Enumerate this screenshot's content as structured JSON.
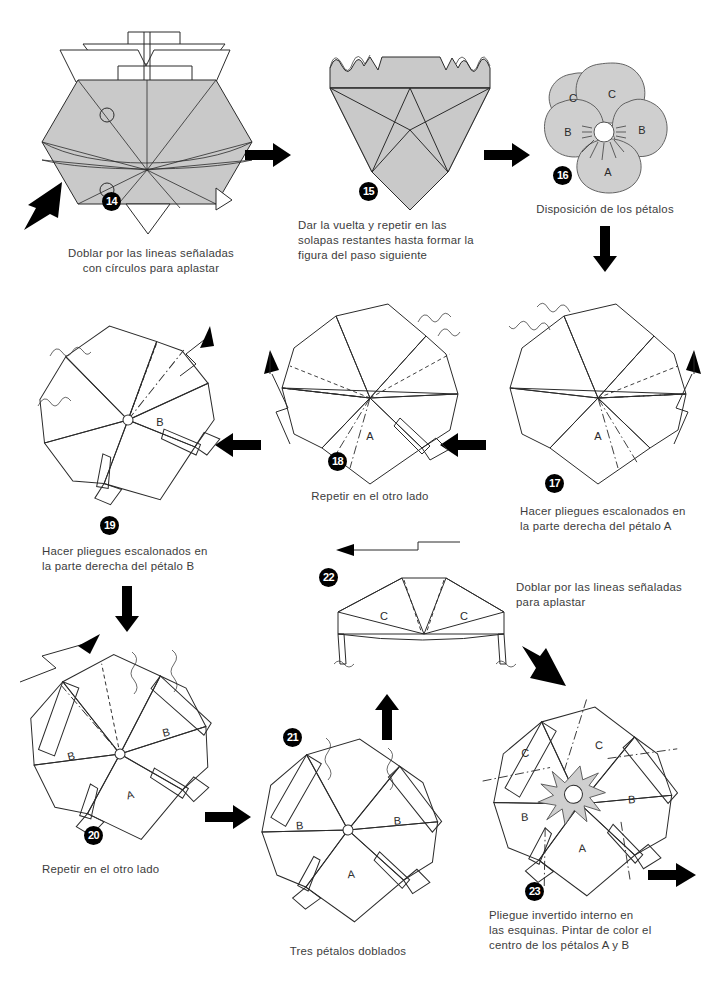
{
  "page": {
    "language": "es",
    "background_color": "#ffffff",
    "paper_fill_color": "#c9c9c9",
    "line_color": "#2b2b2b",
    "text_color": "#3c3c3c",
    "badge_background": "#000000",
    "badge_text_color": "#ffffff"
  },
  "steps": [
    {
      "number": "14",
      "badge": "14",
      "caption": "Doblar por las lineas señaladas\ncon círculos para aplastar",
      "petal_labels": [],
      "markers": [
        "circulo-superior",
        "circulo-inferior"
      ]
    },
    {
      "number": "15",
      "badge": "15",
      "caption": "Dar la vuelta y repetir en las\nsolapas restantes hasta formar la\nfigura del paso siguiente",
      "petal_labels": []
    },
    {
      "number": "16",
      "badge": "16",
      "caption": "Disposición de los pétalos",
      "petal_labels": [
        "C",
        "C",
        "B",
        "B",
        "A"
      ]
    },
    {
      "number": "17",
      "badge": "17",
      "caption": "Hacer pliegues escalonados en\nla parte derecha del pétalo A",
      "petal_labels": [
        "A"
      ]
    },
    {
      "number": "18",
      "badge": "18",
      "caption": "Repetir en el otro lado",
      "petal_labels": [
        "A"
      ]
    },
    {
      "number": "19",
      "badge": "19",
      "caption": "Hacer pliegues escalonados en\nla parte derecha del pétalo B",
      "petal_labels": [
        "B"
      ]
    },
    {
      "number": "20",
      "badge": "20",
      "caption": "Repetir en el otro lado",
      "petal_labels": [
        "B",
        "B",
        "A"
      ]
    },
    {
      "number": "21",
      "badge": "21",
      "caption": "Tres pétalos doblados",
      "petal_labels": [
        "B",
        "B",
        "A"
      ]
    },
    {
      "number": "22",
      "badge": "22",
      "caption": "Doblar por las lineas señaladas\npara aplastar",
      "petal_labels": [
        "C",
        "C"
      ]
    },
    {
      "number": "23",
      "badge": "23",
      "caption": "Pliegue invertido interno en\nlas esquinas. Pintar de color el\ncentro de los pétalos A y B",
      "petal_labels": [
        "C",
        "C",
        "B",
        "B",
        "A"
      ]
    }
  ],
  "flow_arrows": [
    {
      "name": "arrow-14-to-15",
      "direction": "right"
    },
    {
      "name": "arrow-15-to-16",
      "direction": "right"
    },
    {
      "name": "arrow-16-to-17",
      "direction": "down"
    },
    {
      "name": "arrow-17-to-18",
      "direction": "left"
    },
    {
      "name": "arrow-18-to-19",
      "direction": "left"
    },
    {
      "name": "arrow-19-to-20",
      "direction": "down"
    },
    {
      "name": "arrow-20-to-21",
      "direction": "right"
    },
    {
      "name": "arrow-21-to-22",
      "direction": "up"
    },
    {
      "name": "arrow-22-to-23",
      "direction": "down-right"
    },
    {
      "name": "arrow-23-to-next",
      "direction": "right"
    },
    {
      "name": "arrow-entry-into-14",
      "direction": "up-right"
    }
  ]
}
